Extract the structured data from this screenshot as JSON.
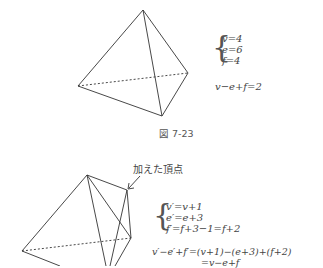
{
  "figure1": {
    "caption": "図 7-23",
    "system": [
      "v=4",
      "e=6",
      "f=4"
    ],
    "euler": "v−e+f=2"
  },
  "figure2": {
    "annotation": "加えた頂点",
    "system": [
      "v′=v+1",
      "e′=e+3",
      "f′=f+3−1=f+2"
    ],
    "derivation_line1": "v′−e′+f′=(v+1)−(e+3)+(f+2)",
    "derivation_line2": "=v−e+f"
  }
}
